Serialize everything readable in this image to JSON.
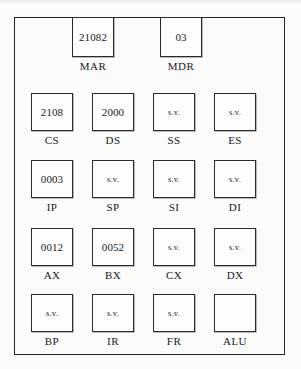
{
  "diagram": {
    "background_color": "#fbfbfa",
    "line_color": "#262626",
    "empty_marker": "s.v.",
    "top_registers": [
      {
        "label": "MAR",
        "value": "21082",
        "x": 72,
        "y": 17
      },
      {
        "label": "MDR",
        "value": "03",
        "x": 160,
        "y": 17
      }
    ],
    "register_rows": [
      {
        "row_name": "segment-registers",
        "y": 93,
        "registers": [
          {
            "label": "CS",
            "value": "2108",
            "x": 31
          },
          {
            "label": "DS",
            "value": "2000",
            "x": 92
          },
          {
            "label": "SS",
            "value": "s.v.",
            "x": 153
          },
          {
            "label": "ES",
            "value": "s.v.",
            "x": 214
          }
        ]
      },
      {
        "row_name": "pointer-index-registers",
        "y": 160,
        "registers": [
          {
            "label": "IP",
            "value": "0003",
            "x": 31
          },
          {
            "label": "SP",
            "value": "s.v.",
            "x": 92
          },
          {
            "label": "SI",
            "value": "s.v.",
            "x": 153
          },
          {
            "label": "DI",
            "value": "s.v.",
            "x": 214
          }
        ]
      },
      {
        "row_name": "general-purpose-registers",
        "y": 228,
        "registers": [
          {
            "label": "AX",
            "value": "0012",
            "x": 31
          },
          {
            "label": "BX",
            "value": "0052",
            "x": 92
          },
          {
            "label": "CX",
            "value": "s.v.",
            "x": 153
          },
          {
            "label": "DX",
            "value": "s.v.",
            "x": 214
          }
        ]
      },
      {
        "row_name": "misc-registers",
        "y": 294,
        "registers": [
          {
            "label": "BP",
            "value": "s.v.",
            "x": 31
          },
          {
            "label": "IR",
            "value": "s.v.",
            "x": 92
          },
          {
            "label": "FR",
            "value": "s.v.",
            "x": 153
          },
          {
            "label": "ALU",
            "value": "",
            "x": 214
          }
        ]
      }
    ]
  }
}
